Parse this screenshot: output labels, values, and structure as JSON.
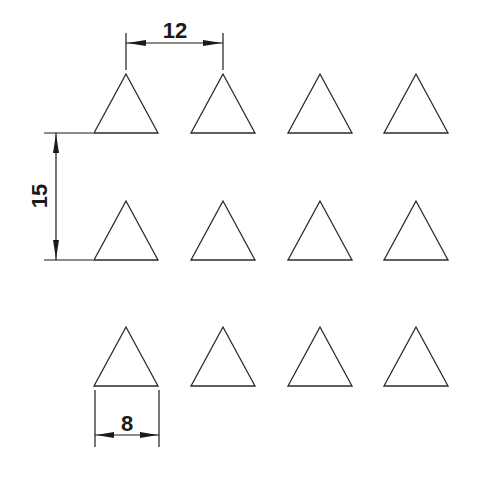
{
  "diagram": {
    "type": "triangle-grid-dimension-drawing",
    "background": "#ffffff",
    "stroke_color": "#2a2a2a",
    "grid": {
      "rows": 3,
      "cols": 4,
      "col_apex_x": [
        126,
        223,
        320,
        416
      ],
      "row_apex_y": [
        74,
        201,
        327
      ],
      "triangle_base_width_px": 64,
      "triangle_height_px": 59
    },
    "dimensions": {
      "horizontal_spacing": {
        "label": "12",
        "value": 12
      },
      "vertical_spacing": {
        "label": "15",
        "value": 15
      },
      "triangle_base": {
        "label": "8",
        "value": 8
      }
    }
  }
}
